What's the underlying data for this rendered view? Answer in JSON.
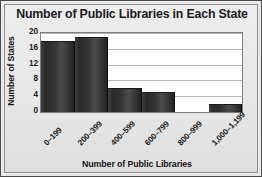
{
  "chart_data": {
    "type": "bar",
    "title": "Number of Public Libraries in Each State",
    "xlabel": "Number of Public Libraries",
    "ylabel": "Number of States",
    "categories": [
      "0–199",
      "200–399",
      "400–599",
      "600–799",
      "800–999",
      "1,000–1,199"
    ],
    "values": [
      18,
      19,
      6,
      5,
      0,
      2
    ],
    "ylim": [
      0,
      20
    ],
    "yticks": [
      0,
      4,
      8,
      12,
      16,
      20
    ],
    "ytick_labels": [
      "0",
      "4",
      "8",
      "12",
      "16",
      "20"
    ],
    "grid": "horizontal",
    "legend": "none",
    "bar_color": "#333333",
    "plot_background": "#ffffff",
    "figure_background": "#e9e9e9",
    "gridline_color": "#b4b4b4"
  }
}
